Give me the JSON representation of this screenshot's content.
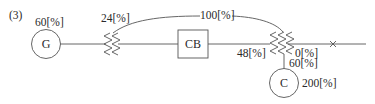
{
  "figure": {
    "label": "(3)",
    "generator": {
      "symbol": "G",
      "value": "60[%]"
    },
    "transformer_left": {
      "value": "24[%]"
    },
    "loop_path": {
      "value": "100[%]"
    },
    "circuit_breaker": {
      "symbol": "CB"
    },
    "transformer_right": {
      "primary_value": "48[%]",
      "secondary_value": "0[%]",
      "tertiary_value": "60[%]"
    },
    "fault_point": {
      "symbol": "×"
    },
    "condenser": {
      "symbol": "C",
      "value": "200[%]"
    }
  },
  "colors": {
    "stroke": "#555555",
    "text": "#2a2a2a",
    "background": "#ffffff"
  }
}
